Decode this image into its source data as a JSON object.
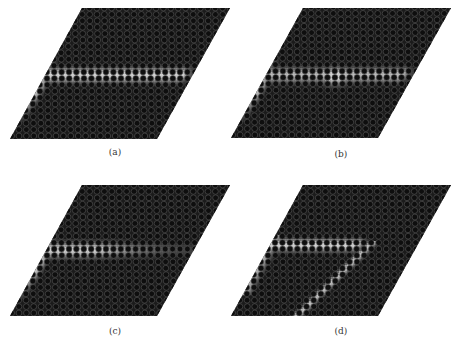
{
  "figure": {
    "panels": [
      {
        "id": "a",
        "label": "(a)",
        "x": 0,
        "y": 0,
        "caption_x": 115,
        "caption_y": 148,
        "quad": {
          "tl": [
            82,
            8
          ],
          "tr": [
            230,
            8
          ],
          "br": [
            157,
            139
          ],
          "bl": [
            10,
            139
          ]
        },
        "field": "straight-waveguide"
      },
      {
        "id": "b",
        "label": "(b)",
        "x": 0,
        "y": 0,
        "caption_x": 341,
        "caption_y": 150,
        "quad": {
          "tl": [
            303,
            8
          ],
          "tr": [
            451,
            8
          ],
          "br": [
            378,
            138
          ],
          "bl": [
            231,
            138
          ]
        },
        "field": "waveguide-with-cavity"
      },
      {
        "id": "c",
        "label": "(c)",
        "x": 0,
        "y": 0,
        "caption_x": 115,
        "caption_y": 327,
        "quad": {
          "tl": [
            82,
            185
          ],
          "tr": [
            230,
            185
          ],
          "br": [
            157,
            316
          ],
          "bl": [
            10,
            316
          ]
        },
        "field": "waveguide-fading"
      },
      {
        "id": "d",
        "label": "(d)",
        "x": 0,
        "y": 0,
        "caption_x": 341,
        "caption_y": 327,
        "quad": {
          "tl": [
            303,
            185
          ],
          "tr": [
            451,
            185
          ],
          "br": [
            378,
            316
          ],
          "bl": [
            231,
            316
          ]
        },
        "field": "bent-waveguide"
      }
    ],
    "colors": {
      "background": "#ffffff",
      "crystal": "#1b1b1b",
      "hole_ring": "#5a5a5a",
      "hole_fill": "#0e0e0e",
      "field_glow": "#e8e8e8",
      "caption": "#333333"
    },
    "lattice": {
      "pitch_x": 7.4,
      "pitch_y": 6.4,
      "hole_r": 2.9
    }
  }
}
